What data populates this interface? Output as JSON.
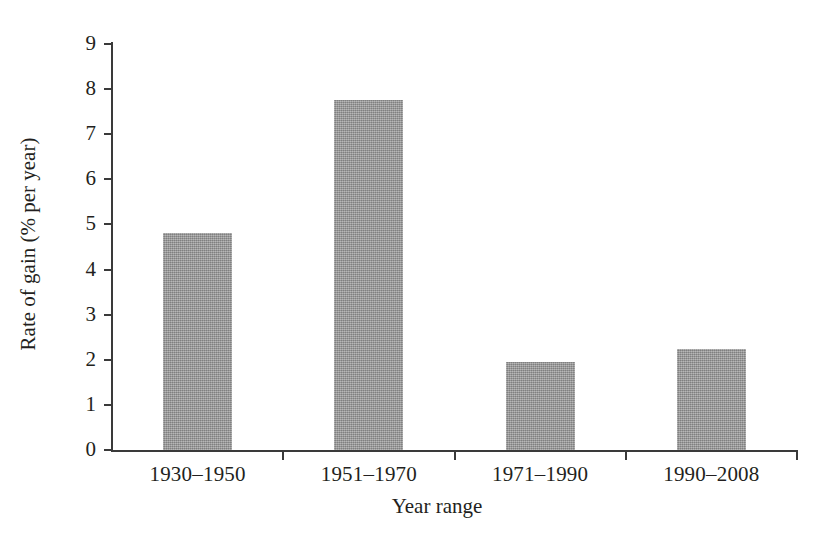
{
  "chart_data": {
    "type": "bar",
    "title": "",
    "subtitle": "",
    "xlabel": "Year range",
    "ylabel": "Rate of gain (% per year)",
    "categories": [
      "1930–1950",
      "1951–1970",
      "1971–1990",
      "1990–2008"
    ],
    "values": [
      4.8,
      7.75,
      1.95,
      2.25
    ],
    "series": [
      {
        "name": "Rate of gain",
        "values": [
          4.8,
          7.75,
          1.95,
          2.25
        ]
      }
    ],
    "ylim": [
      0,
      9
    ],
    "ytick_labels": [
      "9",
      "8",
      "7",
      "6",
      "5",
      "4",
      "3",
      "2",
      "1",
      "0"
    ],
    "ytick_values": [
      9,
      8,
      7,
      6,
      5,
      4,
      3,
      2,
      1,
      0
    ],
    "grid": false,
    "legend": false,
    "legend_position": "none",
    "bar_color": "#9c9c9c",
    "axis_color": "#3a3a3a",
    "text_color": "#231f20",
    "background_color": "#ffffff"
  }
}
